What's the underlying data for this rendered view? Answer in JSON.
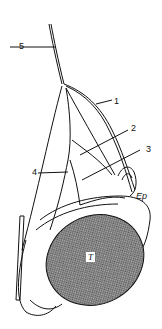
{
  "figure": {
    "type": "anatomical line drawing",
    "colors": {
      "line": "#111111",
      "testis_fill": "#8a8a8a",
      "background": "#ffffff"
    }
  },
  "labels": {
    "l1": "1",
    "l2": "2",
    "l3": "3",
    "l4": "4",
    "l5": "5",
    "ep": "Ep",
    "t": "T"
  }
}
